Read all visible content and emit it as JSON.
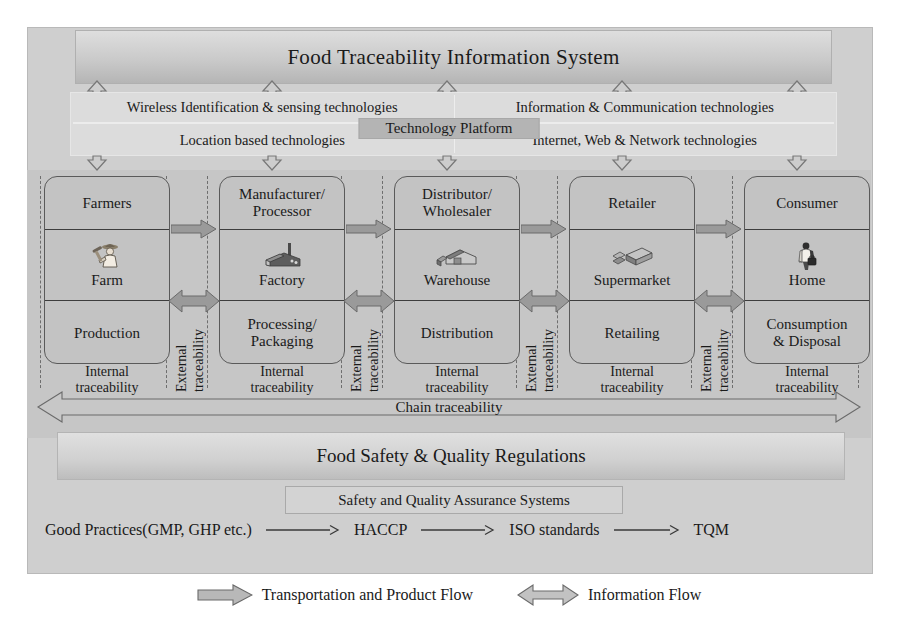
{
  "title": "Food Traceability Information System",
  "technology_platform": {
    "label": "Technology Platform",
    "quadrants": [
      "Wireless Identification & sensing technologies",
      "Information & Communication technologies",
      "Location based technologies",
      "Internet, Web & Network technologies"
    ]
  },
  "chain": {
    "columns": [
      {
        "actor": "Farmers",
        "place": "Farm",
        "stage": "Production",
        "internal": "Internal\ntraceability",
        "icon": "farmer-icon"
      },
      {
        "actor": "Manufacturer/\nProcessor",
        "place": "Factory",
        "stage": "Processing/\nPackaging",
        "internal": "Internal\ntraceability",
        "icon": "factory-icon"
      },
      {
        "actor": "Distributor/\nWholesaler",
        "place": "Warehouse",
        "stage": "Distribution",
        "internal": "Internal\ntraceability",
        "icon": "warehouse-icon"
      },
      {
        "actor": "Retailer",
        "place": "Supermarket",
        "stage": "Retailing",
        "internal": "Internal\ntraceability",
        "icon": "supermarket-icon"
      },
      {
        "actor": "Consumer",
        "place": "Home",
        "stage": "Consumption\n& Disposal",
        "internal": "Internal\ntraceability",
        "icon": "home-icon"
      }
    ],
    "external_label_top": "External",
    "external_label_bottom": "traceability",
    "chain_traceability": "Chain traceability"
  },
  "regulations": "Food Safety & Quality Regulations",
  "assurance": {
    "box_label": "Safety and Quality Assurance Systems",
    "steps": [
      "Good Practices(GMP, GHP etc.)",
      "HACCP",
      "ISO standards",
      "TQM"
    ]
  },
  "legend": {
    "transportation": "Transportation and Product Flow",
    "information": "Information Flow"
  },
  "colors": {
    "page_background": "#ffffff",
    "frame_fill": "#cfcfcf",
    "band_fill": "#c6c6c6",
    "box_fill": "#c3c3c3",
    "box_stroke": "#5a5a5a",
    "arrow_fill": "#9a9a9a",
    "arrow_stroke": "#6a6a6a",
    "text": "#1a1a1a"
  }
}
